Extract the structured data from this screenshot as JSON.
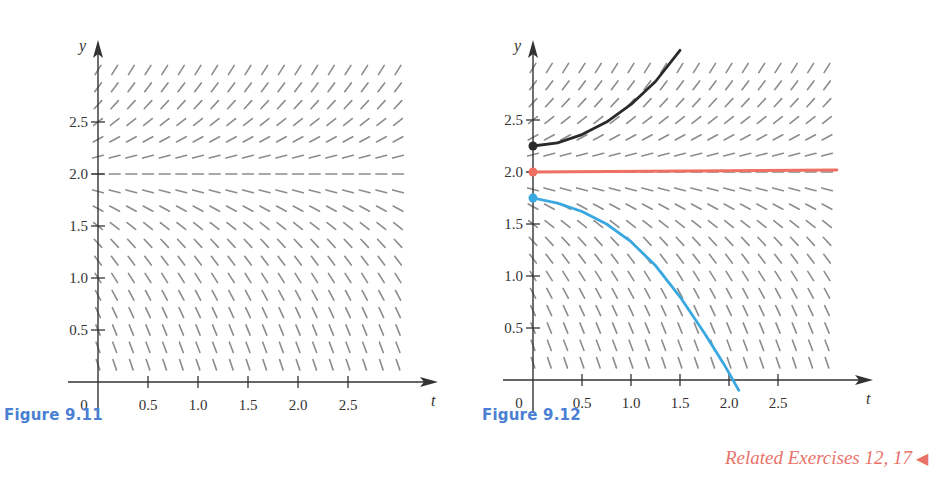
{
  "figures": [
    {
      "id": "fig-9-11",
      "caption": "Figure 9.11",
      "xlabel": "t",
      "ylabel": "y",
      "origin_label": "0",
      "xticks": [
        "0.5",
        "1.0",
        "1.5",
        "2.0",
        "2.5"
      ],
      "yticks": [
        "0.5",
        "1.0",
        "1.5",
        "2.0",
        "2.5"
      ]
    },
    {
      "id": "fig-9-12",
      "caption": "Figure 9.12",
      "xlabel": "t",
      "ylabel": "y",
      "origin_label": "0",
      "xticks": [
        "0.5",
        "1.0",
        "1.5",
        "2.0",
        "2.5"
      ],
      "yticks": [
        "0.5",
        "1.0",
        "1.5",
        "2.0",
        "2.5"
      ]
    }
  ],
  "related_exercises": "Related Exercises 12, 17",
  "colors": {
    "caption": "#4a7fd4",
    "related": "#e8736a",
    "slope_marks": "#8c8c8c",
    "axis": "#333333",
    "solution_upper": "#2a2a2a",
    "solution_equilibrium": "#ef6f62",
    "solution_lower": "#3aa8e0"
  },
  "chart_data": [
    {
      "type": "slope-field",
      "title": "Figure 9.11",
      "equation_form": "dy/dt proportional to (y - 2)",
      "xlabel": "t",
      "ylabel": "y",
      "xlim": [
        0,
        3
      ],
      "ylim": [
        0,
        3
      ],
      "xticks": [
        0.5,
        1.0,
        1.5,
        2.0,
        2.5
      ],
      "yticks": [
        0.5,
        1.0,
        1.5,
        2.0,
        2.5
      ],
      "grid_step": 0.1667,
      "equilibrium_y": 2.0
    },
    {
      "type": "slope-field",
      "title": "Figure 9.12",
      "equation_form": "dy/dt proportional to (y - 2)",
      "xlabel": "t",
      "ylabel": "y",
      "xlim": [
        0,
        3
      ],
      "ylim": [
        0,
        3
      ],
      "xticks": [
        0.5,
        1.0,
        1.5,
        2.0,
        2.5
      ],
      "yticks": [
        0.5,
        1.0,
        1.5,
        2.0,
        2.5
      ],
      "grid_step": 0.1667,
      "equilibrium_y": 2.0,
      "solution_curves": [
        {
          "name": "upper",
          "initial": [
            0,
            2.25
          ],
          "color": "#2a2a2a",
          "points": [
            [
              0,
              2.25
            ],
            [
              0.25,
              2.28
            ],
            [
              0.5,
              2.36
            ],
            [
              0.75,
              2.48
            ],
            [
              1.0,
              2.65
            ],
            [
              1.25,
              2.87
            ],
            [
              1.5,
              3.17
            ]
          ]
        },
        {
          "name": "equilibrium",
          "initial": [
            0,
            2.0
          ],
          "color": "#ef6f62",
          "points": [
            [
              0,
              2.0
            ],
            [
              3.1,
              2.02
            ]
          ]
        },
        {
          "name": "lower",
          "initial": [
            0,
            1.75
          ],
          "color": "#3aa8e0",
          "points": [
            [
              0,
              1.75
            ],
            [
              0.25,
              1.7
            ],
            [
              0.5,
              1.62
            ],
            [
              0.75,
              1.5
            ],
            [
              1.0,
              1.33
            ],
            [
              1.25,
              1.1
            ],
            [
              1.5,
              0.8
            ],
            [
              1.75,
              0.45
            ],
            [
              1.95,
              0.15
            ],
            [
              2.1,
              -0.1
            ]
          ]
        }
      ]
    }
  ]
}
